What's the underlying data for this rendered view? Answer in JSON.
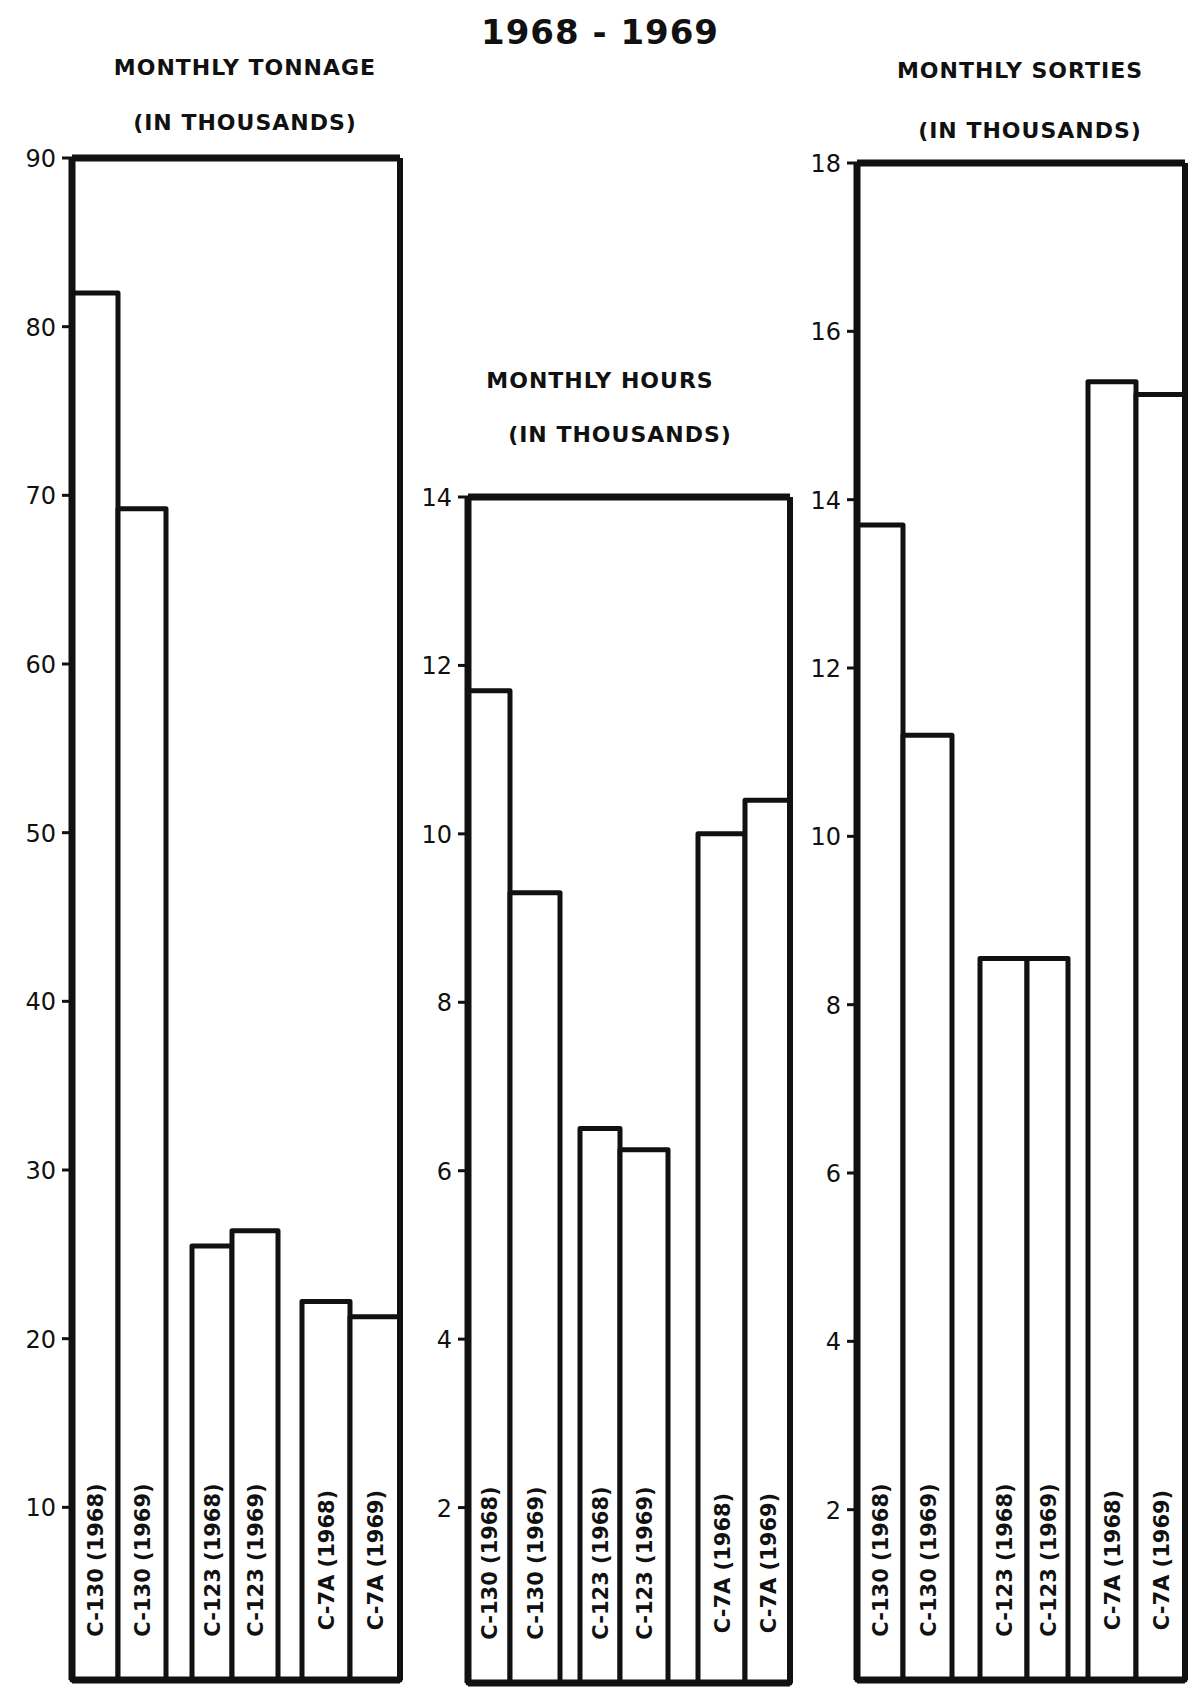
{
  "title": "1968 - 1969",
  "chart_data": [
    {
      "type": "bar",
      "title": "MONTHLY TONNAGE",
      "subtitle": "(IN THOUSANDS)",
      "xlabel": "",
      "ylabel": "",
      "categories": [
        "C-130 (1968)",
        "C-130 (1969)",
        "C-123 (1968)",
        "C-123 (1969)",
        "C-7A (1968)",
        "C-7A (1969)"
      ],
      "values": [
        82,
        69.2,
        25.5,
        26.4,
        22.2,
        21.3
      ],
      "ylim": [
        0,
        90
      ],
      "yticks": [
        10,
        20,
        30,
        40,
        50,
        60,
        70,
        80,
        90
      ],
      "grid": false,
      "legend": null
    },
    {
      "type": "bar",
      "title": "MONTHLY HOURS",
      "subtitle": "(IN THOUSANDS)",
      "xlabel": "",
      "ylabel": "",
      "categories": [
        "C-130 (1968)",
        "C-130 (1969)",
        "C-123 (1968)",
        "C-123 (1969)",
        "C-7A (1968)",
        "C-7A (1969)"
      ],
      "values": [
        11.7,
        9.3,
        6.5,
        6.25,
        10.0,
        10.4
      ],
      "ylim": [
        0,
        14
      ],
      "yticks": [
        2,
        4,
        6,
        8,
        10,
        12,
        14
      ],
      "grid": false,
      "legend": null
    },
    {
      "type": "bar",
      "title": "MONTHLY SORTIES",
      "subtitle": "(IN THOUSANDS)",
      "xlabel": "",
      "ylabel": "",
      "categories": [
        "C-130 (1968)",
        "C-130 (1969)",
        "C-123 (1968)",
        "C-123 (1969)",
        "C-7A (1968)",
        "C-7A (1969)"
      ],
      "values": [
        13.7,
        11.2,
        8.55,
        8.55,
        15.4,
        15.25
      ],
      "ylim": [
        0,
        18
      ],
      "yticks": [
        2,
        4,
        6,
        8,
        10,
        12,
        14,
        16,
        18
      ],
      "grid": false,
      "legend": null
    }
  ],
  "labels": {
    "tonnage_title": "MONTHLY TONNAGE",
    "tonnage_sub": "(IN THOUSANDS)",
    "hours_title": "MONTHLY HOURS",
    "hours_sub": "(IN THOUSANDS)",
    "sorties_title": "MONTHLY SORTIES",
    "sorties_sub": "(IN THOUSANDS)"
  }
}
